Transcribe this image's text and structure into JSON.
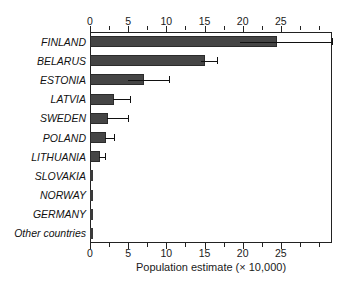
{
  "chart_data": {
    "type": "bar",
    "orientation": "horizontal",
    "title": "",
    "xlabel": "Population estimate (× 10,000)",
    "ylabel": "",
    "xlim": [
      0,
      31.7
    ],
    "xticks": [
      0,
      5,
      10,
      15,
      20,
      25
    ],
    "xticklabels": [
      "0",
      "5",
      "10",
      "15",
      "20",
      "25"
    ],
    "minor_tick_interval": 2.5,
    "axes": "top and bottom",
    "grid": false,
    "legend": null,
    "bar_color": "#454545",
    "error_color": "#111111",
    "categories": [
      "FINLAND",
      "BELARUS",
      "ESTONIA",
      "LATVIA",
      "SWEDEN",
      "POLAND",
      "LITHUANIA",
      "SLOVAKIA",
      "NORWAY",
      "GERMANY",
      "Other countries"
    ],
    "values": [
      24.5,
      15.0,
      7.1,
      3.2,
      2.4,
      2.1,
      1.3,
      0.1,
      0.1,
      0.1,
      0.1
    ],
    "error_low": [
      19.6,
      14.5,
      5.0,
      3.0,
      2.2,
      2.0,
      1.2,
      0,
      0,
      0,
      0
    ],
    "error_high": [
      31.7,
      16.6,
      10.4,
      5.2,
      5.0,
      3.1,
      1.9,
      0,
      0,
      0,
      0
    ]
  }
}
